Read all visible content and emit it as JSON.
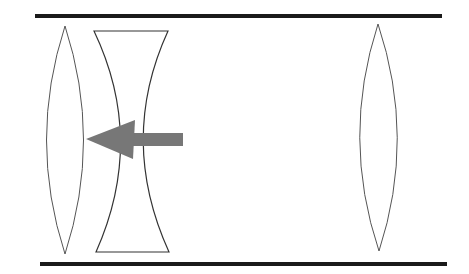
{
  "diagram": {
    "type": "optical-lens-system",
    "colors": {
      "rail": "#1a1a1a",
      "lens_outline": "#555555",
      "arrow": "#777777",
      "background": "#ffffff"
    },
    "elements": [
      {
        "id": "top-rail",
        "kind": "rail"
      },
      {
        "id": "bottom-rail",
        "kind": "rail"
      },
      {
        "id": "left-convex-lens",
        "kind": "convex-lens"
      },
      {
        "id": "concave-lens",
        "kind": "concave-lens"
      },
      {
        "id": "direction-arrow",
        "kind": "arrow",
        "direction": "left"
      },
      {
        "id": "right-convex-lens",
        "kind": "convex-lens"
      }
    ]
  }
}
